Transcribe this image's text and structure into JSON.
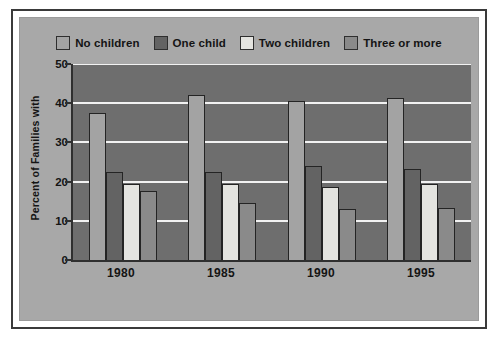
{
  "chart_data": {
    "type": "bar",
    "title": "",
    "subtitle": "",
    "xlabel": "",
    "ylabel": "Percent of Families with",
    "categories": [
      "1980",
      "1985",
      "1990",
      "1995"
    ],
    "series": [
      {
        "name": "No children",
        "color": "#a3a3a3",
        "values": [
          37.5,
          42.0,
          40.5,
          41.3
        ]
      },
      {
        "name": "One child",
        "color": "#636363",
        "values": [
          22.5,
          22.5,
          24.0,
          23.3
        ]
      },
      {
        "name": "Two children",
        "color": "#e4e4e0",
        "values": [
          19.5,
          19.5,
          18.5,
          19.3
        ]
      },
      {
        "name": "Three or more",
        "color": "#8a8a8a",
        "values": [
          17.5,
          14.5,
          13.0,
          13.2
        ]
      }
    ],
    "ylim": [
      0,
      50
    ],
    "yticks": [
      0,
      10,
      20,
      30,
      40,
      50
    ],
    "ytick_labels": [
      "0",
      "10",
      "20",
      "30",
      "40",
      "50"
    ],
    "grid": true,
    "grid_color": "#f2f2f2",
    "legend_position": "top-center",
    "plot_background": "#6e6e6e",
    "figure_background": "#a8a8a8",
    "frame_color": "#3a3a3a"
  }
}
